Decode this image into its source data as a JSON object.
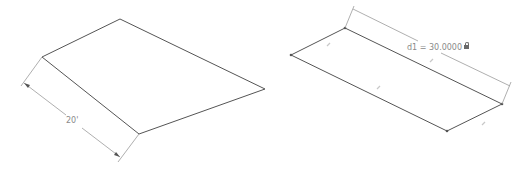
{
  "left_figure": {
    "label": "20'",
    "vertices": [
      [
        42,
        57
      ],
      [
        120,
        19
      ],
      [
        265,
        89
      ],
      [
        139,
        134
      ]
    ],
    "dimension": {
      "from": [
        24,
        83
      ],
      "to": [
        120,
        157
      ],
      "value": "20'"
    }
  },
  "right_figure": {
    "label": "d1 = 30.0000",
    "vertices": [
      [
        291,
        55
      ],
      [
        345,
        28
      ],
      [
        502,
        104
      ],
      [
        447,
        131
      ]
    ],
    "dimension": {
      "name": "d1",
      "value": "30.0000",
      "locked": true
    },
    "edge_constraint_glyphs": 4
  },
  "colors": {
    "edge": "#555555",
    "dimension": "#9a9a9a",
    "text": "#8a8a8a",
    "glyph": "#c8c8c8"
  }
}
